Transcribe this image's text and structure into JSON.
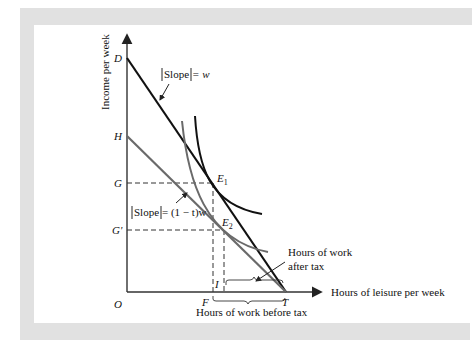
{
  "figure": {
    "frame_color": "#e1e1e1",
    "axes": {
      "y_label": "Income per week",
      "x_label": "Hours of leisure per week",
      "origin_label": "O"
    },
    "y_points": [
      {
        "label": "D",
        "note": "intercept of pre-tax budget line"
      },
      {
        "label": "H",
        "note": "intercept of post-tax budget line"
      },
      {
        "label": "G",
        "note": "income at E1"
      },
      {
        "label": "G'",
        "note": "income at E2"
      }
    ],
    "x_points": [
      {
        "label": "F"
      },
      {
        "label": "I"
      },
      {
        "label": "T"
      }
    ],
    "equilibria": [
      {
        "label": "E",
        "sub": "1"
      },
      {
        "label": "E",
        "sub": "2"
      }
    ],
    "annotations": {
      "slope_pre": {
        "prefix": "Slope",
        "suffix": " = w"
      },
      "slope_post": {
        "prefix": "Slope",
        "suffix": " = (1 − t)w"
      },
      "work_after_tax_line1": "Hours of work",
      "work_after_tax_line2": "after tax",
      "work_before_tax": "Hours of work before tax"
    },
    "colors": {
      "pre_tax_line": "#111111",
      "post_tax_line": "#6a6a6a",
      "indifference_high": "#111111",
      "indifference_low": "#6a6a6a"
    }
  }
}
